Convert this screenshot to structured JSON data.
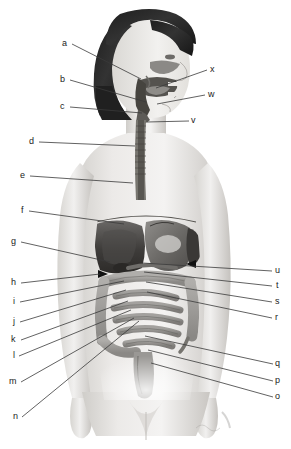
{
  "diagram": {
    "style": "grayscale halftone illustration",
    "colors": {
      "background": "#ffffff",
      "leader_line": "#3a3a3a",
      "label_text": "#1b1b1b",
      "skin_light": "#f0efee",
      "skin_mid": "#d8d6d3",
      "skin_shadow": "#b9b6b2",
      "hair_dark": "#2b2b2b",
      "organ_dark": "#4a4a4a",
      "organ_mid": "#8d8b88",
      "organ_light": "#c2c0bd"
    },
    "signature": "",
    "labels": [
      {
        "id": "a",
        "text": "a",
        "x": 62,
        "y": 39,
        "side": "left",
        "lx": 72,
        "ly": 44,
        "tx": 141,
        "ty": 79
      },
      {
        "id": "b",
        "text": "b",
        "x": 60,
        "y": 75,
        "side": "left",
        "lx": 70,
        "ly": 80,
        "tx": 146,
        "ty": 102
      },
      {
        "id": "c",
        "text": "c",
        "x": 60,
        "y": 102,
        "side": "left",
        "lx": 70,
        "ly": 107,
        "tx": 142,
        "ty": 113
      },
      {
        "id": "d",
        "text": "d",
        "x": 29,
        "y": 137,
        "side": "left",
        "lx": 39,
        "ly": 142,
        "tx": 135,
        "ty": 146
      },
      {
        "id": "e",
        "text": "e",
        "x": 20,
        "y": 171,
        "side": "left",
        "lx": 30,
        "ly": 176,
        "tx": 133,
        "ty": 183
      },
      {
        "id": "f",
        "text": "f",
        "x": 21,
        "y": 206,
        "side": "left",
        "lx": 29,
        "ly": 211,
        "tx": 124,
        "ty": 224
      },
      {
        "id": "g",
        "text": "g",
        "x": 11,
        "y": 237,
        "side": "left",
        "lx": 21,
        "ly": 242,
        "tx": 110,
        "ty": 262
      },
      {
        "id": "h",
        "text": "h",
        "x": 11,
        "y": 278,
        "side": "left",
        "lx": 21,
        "ly": 283,
        "tx": 100,
        "ty": 274
      },
      {
        "id": "i",
        "text": "i",
        "x": 13,
        "y": 297,
        "side": "left",
        "lx": 20,
        "ly": 302,
        "tx": 124,
        "ty": 281
      },
      {
        "id": "j",
        "text": "j",
        "x": 13,
        "y": 317,
        "side": "left",
        "lx": 20,
        "ly": 322,
        "tx": 126,
        "ty": 290
      },
      {
        "id": "k",
        "text": "k",
        "x": 11,
        "y": 335,
        "side": "left",
        "lx": 21,
        "ly": 340,
        "tx": 128,
        "ty": 301
      },
      {
        "id": "l",
        "text": "l",
        "x": 13,
        "y": 351,
        "side": "left",
        "lx": 19,
        "ly": 356,
        "tx": 131,
        "ty": 310
      },
      {
        "id": "m",
        "text": "m",
        "x": 9,
        "y": 377,
        "side": "left",
        "lx": 21,
        "ly": 382,
        "tx": 134,
        "ty": 318
      },
      {
        "id": "n",
        "text": "n",
        "x": 13,
        "y": 412,
        "side": "left",
        "lx": 22,
        "ly": 417,
        "tx": 139,
        "ty": 321
      },
      {
        "id": "o",
        "text": "o",
        "x": 275,
        "y": 392,
        "side": "right",
        "lx": 273,
        "ly": 397,
        "tx": 151,
        "ty": 363
      },
      {
        "id": "p",
        "text": "p",
        "x": 275,
        "y": 376,
        "side": "right",
        "lx": 273,
        "ly": 381,
        "tx": 148,
        "ty": 350
      },
      {
        "id": "q",
        "text": "q",
        "x": 275,
        "y": 359,
        "side": "right",
        "lx": 273,
        "ly": 364,
        "tx": 145,
        "ty": 336
      },
      {
        "id": "r",
        "text": "r",
        "x": 275,
        "y": 313,
        "side": "right",
        "lx": 272,
        "ly": 318,
        "tx": 147,
        "ty": 292
      },
      {
        "id": "s",
        "text": "s",
        "x": 275,
        "y": 297,
        "side": "right",
        "lx": 272,
        "ly": 302,
        "tx": 146,
        "ty": 282
      },
      {
        "id": "t",
        "text": "t",
        "x": 276,
        "y": 281,
        "side": "right",
        "lx": 272,
        "ly": 286,
        "tx": 144,
        "ty": 272
      },
      {
        "id": "u",
        "text": "u",
        "x": 275,
        "y": 266,
        "side": "right",
        "lx": 272,
        "ly": 271,
        "tx": 142,
        "ty": 263
      },
      {
        "id": "v",
        "text": "v",
        "x": 191,
        "y": 116,
        "side": "right",
        "lx": 189,
        "ly": 121,
        "tx": 147,
        "ty": 122
      },
      {
        "id": "w",
        "text": "w",
        "x": 208,
        "y": 90,
        "side": "right",
        "lx": 205,
        "ly": 95,
        "tx": 157,
        "ty": 104
      },
      {
        "id": "x",
        "text": "x",
        "x": 210,
        "y": 65,
        "side": "right",
        "lx": 207,
        "ly": 70,
        "tx": 156,
        "ty": 88
      }
    ]
  }
}
